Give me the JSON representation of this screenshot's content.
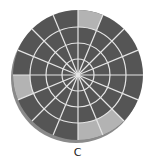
{
  "figure": {
    "label": "C",
    "center": [
      78,
      75
    ],
    "ring_radii": [
      16,
      32,
      48,
      65
    ],
    "sector_count": 16,
    "colors": {
      "dark": "#555555",
      "light": "#b3b3b3",
      "lines": "#e6e6e6",
      "shadow": "#8a8a8a"
    },
    "highlighted_segments": [
      {
        "ring": 4,
        "start_deg": 67.5,
        "end_deg": 90
      },
      {
        "ring": 4,
        "start_deg": 180,
        "end_deg": 202.5
      },
      {
        "ring": 4,
        "start_deg": 270,
        "end_deg": 292.5
      },
      {
        "ring": 4,
        "start_deg": 292.5,
        "end_deg": 315
      }
    ]
  }
}
